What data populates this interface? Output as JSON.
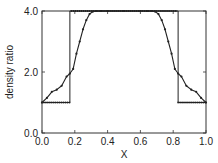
{
  "chart_data": {
    "type": "line",
    "title": "",
    "xlabel": "X",
    "ylabel": "density ratio",
    "xlim": [
      0.0,
      1.0
    ],
    "ylim": [
      0.0,
      4.0
    ],
    "xticks": [
      "0.0",
      "0.2",
      "0.4",
      "0.6",
      "0.8",
      "1.0"
    ],
    "yticks": [
      "0.0",
      "2.0",
      "4.0"
    ],
    "grid": false,
    "legend": null,
    "series": [
      {
        "name": "exact solution",
        "style": "solid line with square step",
        "x": [
          0.0,
          0.17,
          0.17,
          0.83,
          0.83,
          1.0
        ],
        "y": [
          1.0,
          1.0,
          4.0,
          4.0,
          1.0,
          1.0
        ]
      },
      {
        "name": "reference points",
        "style": "dotted markers",
        "x": [
          0.0,
          0.17,
          0.18,
          0.82,
          0.83,
          1.0
        ],
        "y": [
          1.0,
          1.0,
          4.0,
          4.0,
          1.0,
          1.0
        ]
      },
      {
        "name": "numerical solution",
        "style": "line with dot markers",
        "x": [
          0.0,
          0.03,
          0.06,
          0.09,
          0.12,
          0.15,
          0.17,
          0.19,
          0.21,
          0.23,
          0.25,
          0.27,
          0.29,
          0.31,
          0.33,
          0.36,
          0.4,
          0.5,
          0.6,
          0.64,
          0.67,
          0.69,
          0.71,
          0.73,
          0.75,
          0.77,
          0.79,
          0.81,
          0.83,
          0.85,
          0.88,
          0.91,
          0.94,
          0.97,
          1.0
        ],
        "y": [
          1.0,
          1.15,
          1.35,
          1.42,
          1.55,
          1.85,
          1.95,
          2.1,
          2.6,
          3.0,
          3.4,
          3.7,
          3.9,
          3.98,
          4.0,
          4.0,
          4.0,
          4.0,
          4.0,
          4.0,
          4.0,
          3.98,
          3.9,
          3.7,
          3.4,
          3.0,
          2.6,
          2.1,
          1.95,
          1.85,
          1.55,
          1.42,
          1.35,
          1.15,
          1.0
        ]
      }
    ]
  }
}
